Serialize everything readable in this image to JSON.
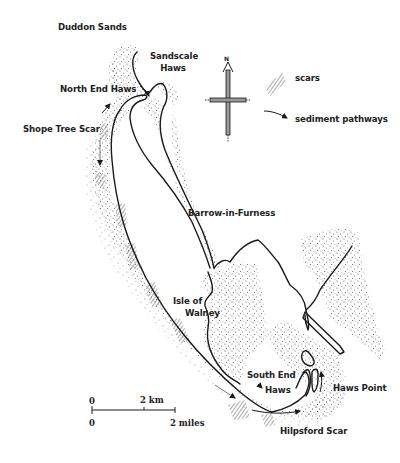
{
  "map": {
    "place_labels": {
      "duddon_sands": "Duddon Sands",
      "sandscale_haws_1": "Sandscale",
      "sandscale_haws_2": "Haws",
      "north_end_haws": "North End Haws",
      "shope_tree_scar": "Shope Tree Scar",
      "barrow_in_furness": "Barrow-in-Furness",
      "isle_of_walney_1": "Isle of",
      "isle_of_walney_2": "Walney",
      "south_end_haws_1": "South End",
      "south_end_haws_2": "Haws",
      "haws_point": "Haws Point",
      "hilpsford_scar": "Hilpsford Scar"
    },
    "legend": {
      "scars": "scars",
      "sediment_pathways": "sediment pathways",
      "compass_north": "N"
    },
    "scale_bar": {
      "km_zero": "0",
      "km_label": "2 km",
      "mi_zero": "0",
      "mi_label": "2 miles"
    },
    "colors": {
      "ink": "#1a1a1a",
      "stipple": "#555555",
      "background": "#ffffff"
    }
  }
}
